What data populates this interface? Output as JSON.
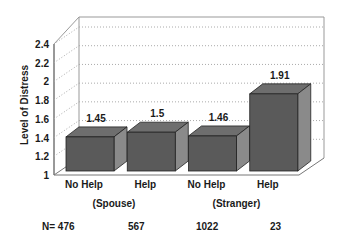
{
  "chart_data": {
    "type": "bar",
    "title": "",
    "ylabel": "Level of Distress",
    "xlabel": "",
    "ylim": [
      1,
      2.4
    ],
    "yticks": [
      "1",
      "1.2",
      "1.4",
      "1.6",
      "1.8",
      "2",
      "2.2",
      "2.4"
    ],
    "grid": true,
    "style": "3d",
    "categories": [
      "No Help",
      "Help",
      "No Help",
      "Help"
    ],
    "values": [
      1.45,
      1.5,
      1.46,
      1.91
    ],
    "value_labels": [
      "1.45",
      "1.5",
      "1.46",
      "1.91"
    ],
    "groups": [
      {
        "label": "(Spouse)",
        "categories": [
          "No Help",
          "Help"
        ]
      },
      {
        "label": "(Stranger)",
        "categories": [
          "No Help",
          "Help"
        ]
      }
    ],
    "n_labels": [
      "N= 476",
      "567",
      "1022",
      "23"
    ],
    "bar_color": "#5a5a5a"
  }
}
